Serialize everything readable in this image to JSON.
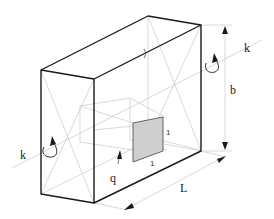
{
  "diagram": {
    "type": "isometric-box",
    "labels": {
      "axis_left": "k",
      "axis_right": "k",
      "height": "b",
      "length": "L",
      "load": "q",
      "unit_side_vertical": "1",
      "unit_side_horizontal": "1"
    },
    "colors": {
      "outline": "#1a1a1a",
      "hidden": "#c8c8c8",
      "unit_fill": "#cfcfcf",
      "dimension": "#bdbdbd"
    }
  }
}
